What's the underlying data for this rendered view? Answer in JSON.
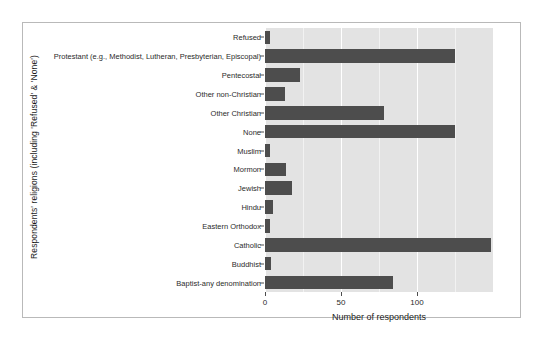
{
  "chart_data": {
    "type": "bar",
    "orientation": "horizontal",
    "title": "",
    "xlabel": "Number of respondents",
    "ylabel": "Respondents' religions (including 'Refused' & 'None')",
    "xlim": [
      0,
      150
    ],
    "ylim": null,
    "grid": true,
    "legend": null,
    "xticks": [
      0,
      50,
      100
    ],
    "xtick_labels": [
      "0",
      "50",
      "100"
    ],
    "categories": [
      "Refused",
      "Protestant (e.g., Methodist, Lutheran, Presbyterian, Episcopal)",
      "Pentecostal",
      "Other non-Christian",
      "Other Christian",
      "None",
      "Muslim",
      "Mormon",
      "Jewish",
      "Hindu",
      "Eastern Orthodox",
      "Catholic",
      "Buddhist",
      "Baptist-any denomination"
    ],
    "values": [
      3,
      125,
      23,
      13,
      78,
      125,
      3,
      14,
      18,
      5,
      3,
      149,
      4,
      84
    ],
    "bar_color": "#4d4d4d",
    "panel_color": "#e3e3e3",
    "gridline_color": "#ffffff"
  },
  "axis": {
    "x_title": "Number of respondents",
    "y_title": "Respondents' religions (including 'Refused' & 'None')"
  }
}
